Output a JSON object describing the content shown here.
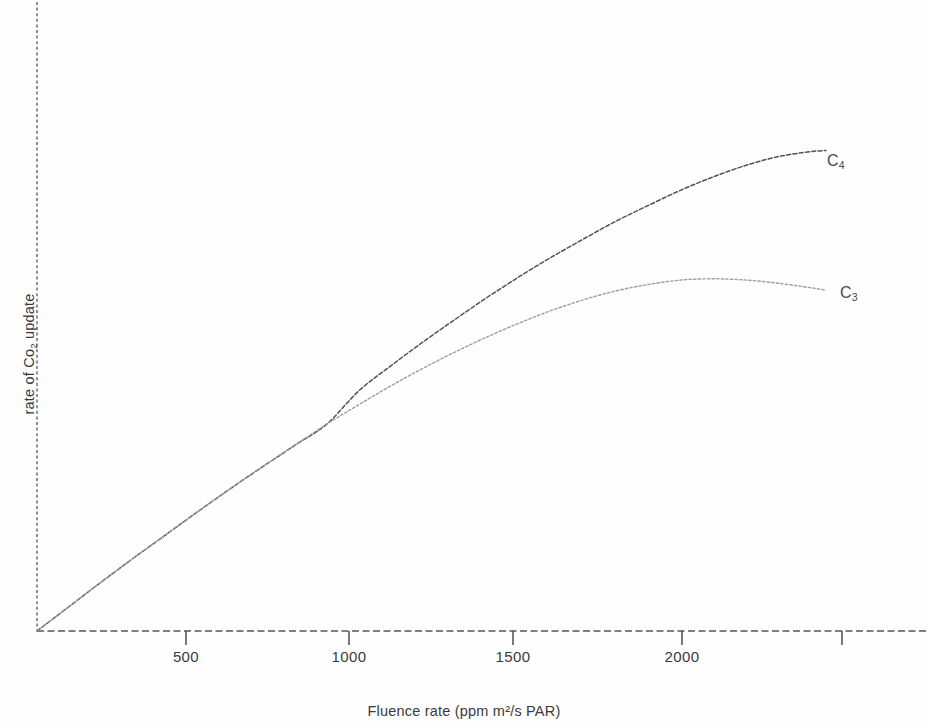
{
  "figure": {
    "alt_title": "Rate of CO2 uptake versus fluence rate for C3 and C4 plants"
  },
  "axes": {
    "x_title": "Fluence rate (ppm m²/s PAR)",
    "y_title_prefix": "rate of Co",
    "y_title_sub": "2",
    "y_title_suffix": " update",
    "x_ticks": [
      "500",
      "1000",
      "1500",
      "2000",
      ""
    ]
  },
  "labels": {
    "c4_prefix": "C",
    "c4_sub": "4",
    "c3_prefix": "C",
    "c3_sub": "3"
  },
  "colors": {
    "c4_curve": "#4a4a4a",
    "c3_curve": "#9a9a9a",
    "axis": "#555555",
    "text": "#3a3a3a"
  },
  "chart_data": {
    "type": "line",
    "title": "",
    "subtitle": "",
    "xlabel": "Fluence rate (ppm m²/s PAR)",
    "ylabel": "rate of Co2 update",
    "xlim": [
      0,
      2700
    ],
    "ylim": [
      0,
      100
    ],
    "xticks": [
      500,
      1000,
      1500,
      2000,
      2500
    ],
    "xticklabels": [
      "500",
      "1000",
      "1500",
      "2000",
      ""
    ],
    "yticks": [],
    "yticklabels": [],
    "grid": false,
    "legend": "inline-right-of-curve-ends",
    "annotations": [
      {
        "text": "C4",
        "x": 2500,
        "y": 76
      },
      {
        "text": "C3",
        "x": 2560,
        "y": 55
      }
    ],
    "series": [
      {
        "name": "C4",
        "color": "#4a4a4a",
        "linestyle": "dashed",
        "x": [
          0,
          100,
          200,
          300,
          400,
          500,
          600,
          700,
          800,
          900,
          1000,
          1100,
          1200,
          1300,
          1400,
          1500,
          1600,
          1700,
          1800,
          1900,
          2000,
          2100,
          2200,
          2300,
          2400,
          2450
        ],
        "y": [
          0,
          3.9,
          7.8,
          11.6,
          15.3,
          19.0,
          22.6,
          26.1,
          29.5,
          32.9,
          38.2,
          42.2,
          46.0,
          49.6,
          53.1,
          56.4,
          59.5,
          62.4,
          65.2,
          67.7,
          70.1,
          72.2,
          74.0,
          75.4,
          76.2,
          76.4
        ]
      },
      {
        "name": "C3",
        "color": "#9a9a9a",
        "linestyle": "dotted",
        "x": [
          0,
          100,
          200,
          300,
          400,
          500,
          600,
          700,
          800,
          900,
          1000,
          1100,
          1200,
          1300,
          1400,
          1500,
          1600,
          1700,
          1800,
          1900,
          2000,
          2100,
          2200,
          2300,
          2400,
          2450
        ],
        "y": [
          0,
          3.9,
          7.8,
          11.6,
          15.3,
          19.0,
          22.6,
          26.1,
          29.5,
          32.9,
          36.0,
          39.0,
          41.8,
          44.4,
          46.8,
          49.0,
          51.0,
          52.7,
          54.1,
          55.1,
          55.8,
          56.0,
          55.8,
          55.3,
          54.6,
          54.2
        ]
      }
    ]
  }
}
